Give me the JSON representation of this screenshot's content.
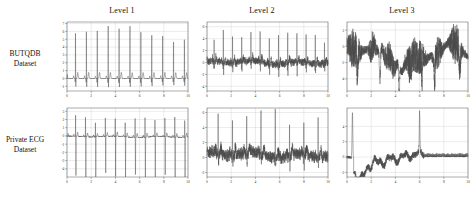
{
  "figure": {
    "column_titles": [
      "Level 1",
      "Level 2",
      "Level 3"
    ],
    "row_labels": [
      {
        "line1": "BUTQDB",
        "line2": "Dataset"
      },
      {
        "line1": "Private ECG",
        "line2": "Dataset"
      }
    ]
  },
  "chart_data": [
    {
      "id": "butqdb-level-1",
      "type": "line",
      "title": "Level 1",
      "row": "BUTQDB Dataset",
      "xlabel": "",
      "ylabel": "",
      "xlim": [
        0,
        10
      ],
      "ylim": [
        -1.6,
        7.2
      ],
      "xticks": [
        0,
        2,
        4,
        6,
        8,
        10
      ],
      "yticks": [
        -1,
        0,
        1,
        2,
        3,
        4,
        5,
        6,
        7
      ],
      "grid": true,
      "legend": "none",
      "description": "Clean ECG, 11 sharp R-peaks reaching about 6.5, flat baseline near 0 with small P and T waves",
      "signal": {
        "kind": "ecg",
        "samples": 1100,
        "beats": 11,
        "first_beat_x": 0.42,
        "beat_period": 0.9,
        "r_amp": 6.5,
        "r_jitter": 0.35,
        "q_amp": -0.55,
        "s_amp": -0.9,
        "t_amp": 0.75,
        "p_amp": 0.32,
        "baseline": 0.0,
        "noise": 0.035,
        "wander": 0.0
      }
    },
    {
      "id": "butqdb-level-2",
      "type": "line",
      "title": "Level 2",
      "row": "BUTQDB Dataset",
      "xlabel": "",
      "ylabel": "",
      "xlim": [
        0,
        10
      ],
      "ylim": [
        -4.8,
        6.8
      ],
      "xticks": [
        0,
        2,
        4,
        6,
        8,
        10
      ],
      "yticks": [
        -4,
        -2,
        0,
        2,
        4,
        6
      ],
      "grid": true,
      "legend": "none",
      "description": "Moderately noisy ECG, R-peaks about 4 to 6 still visible above dense baseline noise, occasional negative excursions to -3",
      "signal": {
        "kind": "ecg",
        "samples": 1500,
        "beats": 13,
        "first_beat_x": 0.35,
        "beat_period": 0.76,
        "r_amp": 5.0,
        "r_jitter": 1.1,
        "q_amp": -0.8,
        "s_amp": -1.5,
        "t_amp": 0.8,
        "p_amp": 0.4,
        "baseline": 0.0,
        "noise": 0.42,
        "wander": 0.35
      }
    },
    {
      "id": "butqdb-level-3",
      "type": "line",
      "title": "Level 3",
      "row": "BUTQDB Dataset",
      "xlabel": "",
      "ylabel": "",
      "xlim": [
        0,
        10
      ],
      "ylim": [
        -5.5,
        3.0
      ],
      "xticks": [
        0,
        2,
        4,
        6,
        8,
        10
      ],
      "yticks": [
        -4,
        -2,
        0,
        2
      ],
      "grid": true,
      "legend": "none",
      "description": "Severely corrupted signal, no recognisable ECG morphology, dense high amplitude noise bursts between -5 and 2.5",
      "signal": {
        "kind": "noise-burst",
        "samples": 1700,
        "baseline": -1.1,
        "noise": 0.62,
        "wander": 1.05,
        "burst_count": 7,
        "burst_amp": 2.6,
        "dropout_count": 6,
        "dropout_amp": -4.4
      }
    },
    {
      "id": "private-ecg-level-1",
      "type": "line",
      "title": "Level 1",
      "row": "Private ECG Dataset",
      "xlabel": "",
      "ylabel": "",
      "xlim": [
        0,
        10
      ],
      "ylim": [
        -5.0,
        3.4
      ],
      "xticks": [
        0,
        2,
        4,
        6,
        8,
        10
      ],
      "yticks": [
        -4,
        -3,
        -2,
        -1,
        0,
        1,
        2,
        3
      ],
      "grid": true,
      "legend": "none",
      "description": "Clean ECG with positive R-peaks near 2.5 followed by deep S-waves to about -4.3, 12 regular beats, flat baseline",
      "signal": {
        "kind": "ecg-biphasic",
        "samples": 1200,
        "beats": 12,
        "first_beat_x": 0.45,
        "beat_period": 0.82,
        "r_amp": 2.5,
        "r_jitter": 0.25,
        "s_amp": -4.3,
        "t_amp": 0.45,
        "p_amp": 0.22,
        "baseline": -0.1,
        "noise": 0.05,
        "wander": 0.08
      }
    },
    {
      "id": "private-ecg-level-2",
      "type": "line",
      "title": "Level 2",
      "row": "Private ECG Dataset",
      "xlabel": "",
      "ylabel": "",
      "xlim": [
        0,
        10
      ],
      "ylim": [
        -2.6,
        6.6
      ],
      "xticks": [
        0,
        2,
        4,
        6,
        8,
        10
      ],
      "yticks": [
        -2,
        0,
        2,
        4,
        6
      ],
      "grid": true,
      "legend": "none",
      "description": "Noisy ECG, thick fuzzy baseline around 0 to 1 with eight tall narrow R-peaks reaching 4 to 6",
      "signal": {
        "kind": "ecg",
        "samples": 1600,
        "beats": 8,
        "first_beat_x": 0.55,
        "beat_period": 1.18,
        "r_amp": 5.3,
        "r_jitter": 0.9,
        "q_amp": -0.6,
        "s_amp": -1.2,
        "t_amp": 0.9,
        "p_amp": 0.5,
        "baseline": 0.35,
        "noise": 0.55,
        "wander": 0.45
      }
    },
    {
      "id": "private-ecg-level-3",
      "type": "line",
      "title": "Level 3",
      "row": "Private ECG Dataset",
      "xlabel": "",
      "ylabel": "",
      "xlim": [
        0,
        10
      ],
      "ylim": [
        -2.6,
        6.4
      ],
      "xticks": [
        0,
        2,
        4,
        6,
        8,
        10
      ],
      "yticks": [
        -2,
        0,
        2,
        4
      ],
      "grid": true,
      "legend": "none",
      "description": "Corrupted signal, large initial spike to 6 then drop to -2, irregular wandering segment rising to a spike near 4.8 at x=6, then a flat low amplitude saturated tail",
      "signal": {
        "kind": "drift-spike",
        "samples": 1500,
        "baseline": 0.0,
        "noise": 0.18,
        "spike1_x": 0.45,
        "spike1_amp": 6.0,
        "trough_x": 1.1,
        "trough_amp": -2.1,
        "spike2_x": 6.0,
        "spike2_amp": 4.8,
        "tail_start_x": 6.4,
        "tail_amp": 0.1,
        "tail_noise": 0.22
      }
    }
  ]
}
